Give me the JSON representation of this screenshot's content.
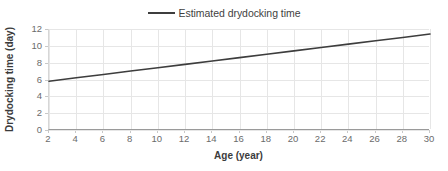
{
  "legend": {
    "position": "top-center",
    "entries": [
      {
        "label": "Estimated drydocking time",
        "marker": "line-marker-icon",
        "color": "#3d3d3d"
      }
    ]
  },
  "axes": {
    "x": {
      "title": "Age (year)",
      "ticks": [
        "2",
        "4",
        "6",
        "8",
        "10",
        "12",
        "14",
        "16",
        "18",
        "20",
        "22",
        "24",
        "26",
        "28",
        "30"
      ]
    },
    "y": {
      "title": "Drydocking time (day)",
      "ticks": [
        "12",
        "10",
        "8",
        "6",
        "4",
        "2",
        "0"
      ]
    }
  },
  "style": {
    "line_color": "#3d3d3d",
    "grid_color": "#e6e6e6",
    "axis_color": "#9a9a9a",
    "tick_label_color": "#6b6b6b",
    "title_color": "#3b3b3b",
    "background": "#ffffff"
  },
  "chart_data": {
    "type": "line",
    "title": "",
    "subtitle": "",
    "xlabel": "Age (year)",
    "ylabel": "Drydocking time (day)",
    "xlim": [
      2,
      30
    ],
    "ylim": [
      0,
      12
    ],
    "xticks": [
      2,
      4,
      6,
      8,
      10,
      12,
      14,
      16,
      18,
      20,
      22,
      24,
      26,
      28,
      30
    ],
    "yticks": [
      0,
      2,
      4,
      6,
      8,
      10,
      12
    ],
    "grid": true,
    "legend_position": "top-center",
    "annotations": [],
    "series": [
      {
        "name": "Estimated drydocking time",
        "color": "#3d3d3d",
        "x": [
          2,
          4,
          6,
          8,
          10,
          12,
          14,
          16,
          18,
          20,
          22,
          24,
          26,
          28,
          30
        ],
        "values": [
          5.8,
          6.2,
          6.6,
          7.0,
          7.4,
          7.8,
          8.2,
          8.6,
          9.0,
          9.4,
          9.8,
          10.2,
          10.6,
          11.0,
          11.4
        ]
      }
    ]
  }
}
